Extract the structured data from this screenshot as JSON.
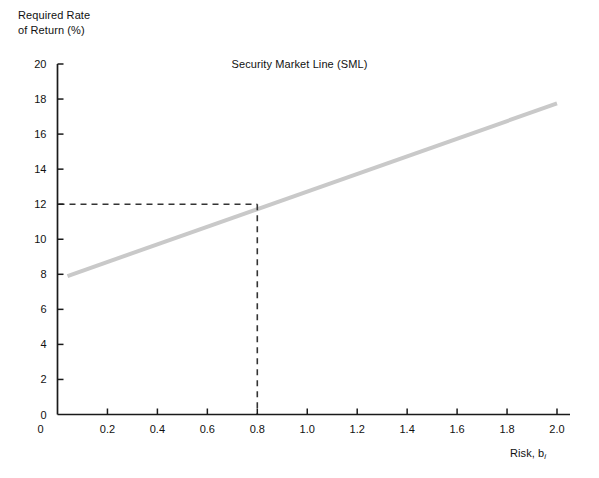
{
  "chart_data": {
    "type": "line",
    "title": "Security Market Line (SML)",
    "xlabel": "Risk, b",
    "xlabel_subscript": "i",
    "ylabel_line1": "Required Rate",
    "ylabel_line2": "of Return (%)",
    "xlim": [
      0,
      2.0
    ],
    "ylim": [
      0,
      20
    ],
    "xticks": [
      "0",
      "0.2",
      "0.4",
      "0.6",
      "0.8",
      "1.0",
      "1.2",
      "1.4",
      "1.6",
      "1.8",
      "2.0"
    ],
    "xtick_values": [
      0,
      0.2,
      0.4,
      0.6,
      0.8,
      1.0,
      1.2,
      1.4,
      1.6,
      1.8,
      2.0
    ],
    "yticks": [
      "0",
      "2",
      "4",
      "6",
      "8",
      "10",
      "12",
      "14",
      "16",
      "18",
      "20"
    ],
    "ytick_values": [
      0,
      2,
      4,
      6,
      8,
      10,
      12,
      14,
      16,
      18,
      20
    ],
    "grid": false,
    "legend": "none",
    "series": [
      {
        "name": "Security Market Line (SML)",
        "x": [
          0.04,
          2.0
        ],
        "y": [
          7.9,
          17.75
        ],
        "color": "#c9c9c9",
        "width": 4
      }
    ],
    "annotations": [
      {
        "name": "risk-free-intercept",
        "type": "point",
        "x": 0,
        "y": 8,
        "label": "8"
      },
      {
        "name": "marked-point",
        "type": "dashed-guides",
        "x": 0.8,
        "y": 12,
        "color": "#333333",
        "x_label": "0.8",
        "y_label": "12"
      }
    ]
  },
  "axes": {
    "line_color": "#1a1a1a",
    "tick_direction": "inward"
  }
}
